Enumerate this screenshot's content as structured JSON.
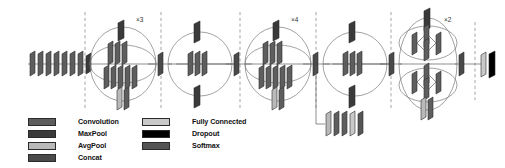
{
  "figure": {
    "type": "neural-network-architecture-diagram"
  },
  "repeat_labels": [
    {
      "id": "x3",
      "text": "×3",
      "stage": "inception-block-a"
    },
    {
      "id": "x4",
      "text": "×4",
      "stage": "inception-block-b"
    },
    {
      "id": "x2",
      "text": "×2",
      "stage": "inception-block-c"
    }
  ],
  "legend": {
    "columns": [
      {
        "items": [
          {
            "label": "Convolution",
            "color": "#5e5e5e",
            "key": "convolution"
          },
          {
            "label": "MaxPool",
            "color": "#3a3a3a",
            "key": "maxpool"
          },
          {
            "label": "AvgPool",
            "color": "#b9b9b9",
            "key": "avgpool"
          },
          {
            "label": "Concat",
            "color": "#4a4a4a",
            "key": "concat"
          }
        ]
      },
      {
        "items": [
          {
            "label": "Fully Connected",
            "color": "#c9c9c9",
            "key": "fully-connected"
          },
          {
            "label": "Dropout",
            "color": "#000000",
            "key": "dropout"
          },
          {
            "label": "Softmax",
            "color": "#555555",
            "key": "softmax"
          }
        ]
      }
    ]
  },
  "colors": {
    "convolution": "#5e5e5e",
    "maxpool": "#3a3a3a",
    "avgpool": "#b9b9b9",
    "concat": "#4a4a4a",
    "fully_connected": "#c9c9c9",
    "dropout": "#000000",
    "softmax": "#555555",
    "outline": "#2b2b2b",
    "connector": "#5a5a5a",
    "divider": "#8a8a8a",
    "background": "#ffffff"
  },
  "stages": [
    {
      "name": "stem",
      "kind": "sequential-stack",
      "block_count": 8,
      "block_types": [
        "convolution",
        "convolution",
        "convolution",
        "convolution",
        "convolution",
        "convolution",
        "convolution",
        "maxpool"
      ]
    },
    {
      "name": "inception-block-a",
      "kind": "inception",
      "repeat": "×3",
      "branches": [
        {
          "blocks": [
            "maxpool"
          ]
        },
        {
          "blocks": [
            "convolution",
            "convolution",
            "convolution"
          ]
        },
        {
          "blocks": [
            "convolution",
            "convolution",
            "convolution",
            "convolution",
            "convolution"
          ]
        },
        {
          "blocks": [
            "avgpool",
            "convolution"
          ]
        }
      ],
      "output": [
        "concat"
      ]
    },
    {
      "name": "reduction-a",
      "kind": "reduction",
      "branches": [
        {
          "blocks": [
            "maxpool"
          ]
        },
        {
          "blocks": [
            "convolution",
            "convolution",
            "convolution"
          ]
        },
        {
          "blocks": [
            "maxpool"
          ]
        }
      ],
      "output": [
        "concat"
      ]
    },
    {
      "name": "inception-block-b",
      "kind": "inception",
      "repeat": "×4",
      "branches": [
        {
          "blocks": [
            "maxpool"
          ]
        },
        {
          "blocks": [
            "convolution",
            "convolution",
            "convolution"
          ]
        },
        {
          "blocks": [
            "convolution",
            "convolution",
            "convolution",
            "convolution",
            "convolution"
          ]
        },
        {
          "blocks": [
            "avgpool",
            "convolution"
          ]
        }
      ],
      "output": [
        "concat"
      ]
    },
    {
      "name": "reduction-b",
      "kind": "reduction",
      "branches": [
        {
          "blocks": [
            "maxpool"
          ]
        },
        {
          "blocks": [
            "convolution",
            "convolution",
            "convolution"
          ]
        },
        {
          "blocks": [
            "maxpool"
          ]
        }
      ],
      "output": [
        "concat"
      ]
    },
    {
      "name": "auxiliary-classifier",
      "kind": "branch-stack",
      "block_count": 5,
      "block_types": [
        "avgpool",
        "convolution",
        "convolution",
        "fully_connected",
        "softmax"
      ]
    },
    {
      "name": "inception-block-c",
      "kind": "inception-split",
      "repeat": "×2",
      "branches": [
        {
          "blocks": [
            "maxpool"
          ]
        },
        {
          "blocks": [
            "convolution",
            "convolution",
            "convolution"
          ],
          "split": true
        },
        {
          "blocks": [
            "convolution",
            "convolution",
            "convolution"
          ],
          "split": true
        },
        {
          "blocks": [
            "avgpool",
            "convolution"
          ]
        }
      ],
      "output": [
        "concat"
      ]
    },
    {
      "name": "classifier-head",
      "kind": "sequential-stack",
      "block_count": 3,
      "block_types": [
        "concat",
        "fully_connected",
        "dropout"
      ]
    }
  ]
}
